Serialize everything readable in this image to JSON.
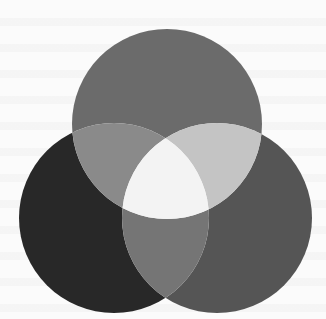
{
  "diagram": {
    "type": "venn-3",
    "labels": [],
    "canvas": {
      "width": 326,
      "height": 319,
      "background": "#fbfbfb"
    },
    "circles": [
      {
        "id": "top",
        "cx": 167,
        "cy": 124,
        "r": 95
      },
      {
        "id": "left",
        "cx": 114,
        "cy": 218,
        "r": 95
      },
      {
        "id": "right",
        "cx": 217,
        "cy": 218,
        "r": 95
      }
    ],
    "region_colors": {
      "top_only": "#6b6b6b",
      "left_only": "#282828",
      "right_only": "#555555",
      "top_left": "#8a8a8a",
      "top_right": "#c4c4c4",
      "left_right": "#757575",
      "all_three": "#f3f3f3"
    }
  }
}
